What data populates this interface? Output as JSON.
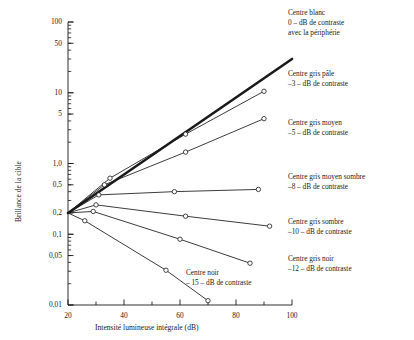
{
  "chart_data": {
    "type": "line",
    "title": "",
    "xlabel": "Intensité lumineuse intégrale (dB)",
    "ylabel": "Brillance de la cible",
    "xlim": [
      20,
      100
    ],
    "ylim": [
      0.01,
      100
    ],
    "yscale": "log",
    "xscale": "linear",
    "grid": false,
    "legend_position": "right-annotations",
    "xticks": [
      20,
      40,
      60,
      80,
      100
    ],
    "xticklabels": [
      "20",
      "40",
      "60",
      "80",
      "100"
    ],
    "yticks": [
      100,
      50,
      10,
      5,
      1.0,
      0.5,
      0.2,
      0.1,
      0.05,
      0.01
    ],
    "yticklabels": [
      "100",
      "50",
      "10",
      "5",
      "1,0",
      "0,5",
      "0,2",
      "0,1",
      "0,05",
      "0,01"
    ],
    "origin_point": {
      "x": 20,
      "y": 0.2
    },
    "series": [
      {
        "name": "Centre blanc 0 dB",
        "contrast_db": 0,
        "style": "thick",
        "markers": false,
        "x": [
          20,
          100
        ],
        "y": [
          0.2,
          30
        ]
      },
      {
        "name": "Centre gris pâle -3 dB",
        "contrast_db": -3,
        "style": "thin",
        "markers": true,
        "x": [
          20,
          35,
          62,
          90
        ],
        "y": [
          0.2,
          0.62,
          2.6,
          10.5
        ]
      },
      {
        "name": "Centre gris moyen -5 dB",
        "contrast_db": -5,
        "style": "thin",
        "markers": true,
        "x": [
          20,
          33,
          62,
          90
        ],
        "y": [
          0.2,
          0.5,
          1.45,
          4.3
        ]
      },
      {
        "name": "Centre gris moyen sombre -8 dB",
        "contrast_db": -8,
        "style": "thin",
        "markers": true,
        "x": [
          20,
          31,
          58,
          88
        ],
        "y": [
          0.2,
          0.36,
          0.4,
          0.43
        ]
      },
      {
        "name": "Centre gris sombre -10 dB",
        "contrast_db": -10,
        "style": "thin",
        "markers": true,
        "x": [
          20,
          30,
          62,
          92
        ],
        "y": [
          0.2,
          0.26,
          0.18,
          0.13
        ]
      },
      {
        "name": "Centre gris noir -12 dB",
        "contrast_db": -12,
        "style": "thin",
        "markers": true,
        "x": [
          20,
          29,
          60,
          85
        ],
        "y": [
          0.2,
          0.21,
          0.085,
          0.039
        ]
      },
      {
        "name": "Centre noir -15 dB",
        "contrast_db": -15,
        "style": "thin",
        "markers": true,
        "x": [
          20,
          26,
          55,
          70
        ],
        "y": [
          0.2,
          0.155,
          0.031,
          0.0115
        ]
      }
    ],
    "annotations": [
      {
        "id": "white",
        "lines": [
          "Centre blanc",
          "0 – dB de contraste",
          "avec la périphérie"
        ]
      },
      {
        "id": "pale-grey",
        "lines": [
          "Centre gris pâle",
          "–3 – dB de contraste"
        ]
      },
      {
        "id": "mid-grey",
        "lines": [
          "Centre gris moyen",
          "–5 – dB de contraste"
        ]
      },
      {
        "id": "mid-dark-grey",
        "lines": [
          "Centre gris moyen sombre",
          "–8 – dB de contraste"
        ]
      },
      {
        "id": "dark-grey",
        "lines": [
          "Centre gris sombre",
          "–10 – dB de contraste"
        ]
      },
      {
        "id": "black-grey",
        "lines": [
          "Centre gris noir",
          "–12 – dB de contraste"
        ]
      },
      {
        "id": "black",
        "lines": [
          "Centre noir",
          "– 15 – dB de contraste"
        ]
      }
    ]
  },
  "annotation_text": {
    "white_l1": "Centre blanc",
    "white_l2": "0 – dB de contraste",
    "white_l3": "avec la périphérie",
    "pale_l1": "Centre gris pâle",
    "pale_l2": "–3 – dB de contraste",
    "mid_l1": "Centre gris moyen",
    "mid_l2": "–5 – dB de contraste",
    "middark_l1": "Centre gris moyen sombre",
    "middark_l2": "–8 – dB de contraste",
    "dark_l1": "Centre gris sombre",
    "dark_l2": "–10 – dB de contraste",
    "blackgrey_l1": "Centre gris noir",
    "blackgrey_l2": "–12 – dB de contraste",
    "black_l1": "Centre noir",
    "black_l2": "– 15 – dB de contraste"
  },
  "axes": {
    "x_title": "Intensité lumineuse intégrale (dB)",
    "y_title": "Brillance de la cible",
    "x_labels": [
      "20",
      "40",
      "60",
      "80",
      "100"
    ],
    "y_labels": [
      "100",
      "50",
      "10",
      "5",
      "1,0",
      "0,5",
      "0,2",
      "0,1",
      "0,05",
      "0,01"
    ]
  },
  "colors": {
    "ink": "#1a1a1a",
    "background": "#ffffff",
    "line": "#000000"
  }
}
